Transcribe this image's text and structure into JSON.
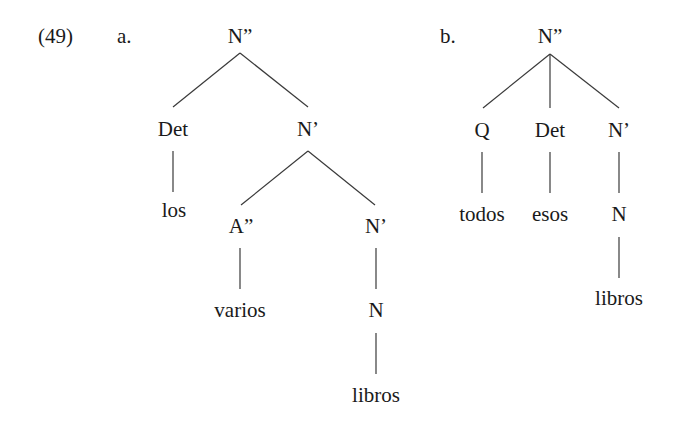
{
  "example": {
    "number": "(49)",
    "trees": [
      {
        "label": "a.",
        "root": "N”",
        "nodes": {
          "root": "N”",
          "det": "Det",
          "det_word": "los",
          "nbar": "N’",
          "adj_phrase": "A”",
          "adj_word": "varios",
          "nbar_inner": "N’",
          "noun": "N",
          "noun_word": "libros"
        },
        "structure": "[N” [Det los] [N’ [A” varios] [N’ [N libros]]]]"
      },
      {
        "label": "b.",
        "root": "N”",
        "nodes": {
          "root": "N”",
          "quant": "Q",
          "quant_word": "todos",
          "det": "Det",
          "det_word": "esos",
          "nbar": "N’",
          "noun": "N",
          "noun_word": "libros"
        },
        "structure": "[N” [Q todos] [Det esos] [N’ [N libros]]]"
      }
    ]
  },
  "colors": {
    "ink": "#1a1a1a",
    "edge": "#3a3a3a",
    "background": "#ffffff"
  }
}
